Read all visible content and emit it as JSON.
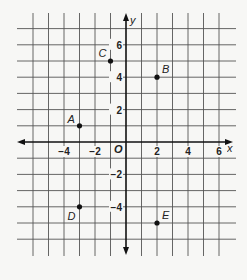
{
  "chart_data": {
    "type": "scatter",
    "title": "",
    "xlabel": "x",
    "ylabel": "y",
    "origin_label": "O",
    "xlim": [
      -6,
      6
    ],
    "ylim": [
      -6,
      7
    ],
    "grid": true,
    "x_ticks": [
      -4,
      -2,
      2,
      4,
      6
    ],
    "x_tick_labels": [
      "−4",
      "−2",
      "2",
      "4",
      "6"
    ],
    "y_ticks": [
      6,
      4,
      2,
      -2,
      -4
    ],
    "y_tick_labels": [
      "6",
      "4",
      "2",
      "−2",
      "−4"
    ],
    "points": [
      {
        "label": "A",
        "x": -3,
        "y": 1
      },
      {
        "label": "B",
        "x": 2,
        "y": 4
      },
      {
        "label": "C",
        "x": -1,
        "y": 5
      },
      {
        "label": "D",
        "x": -3,
        "y": -4
      },
      {
        "label": "E",
        "x": 2,
        "y": -5
      }
    ],
    "colors": {
      "grid": "#555555",
      "axis": "#111111",
      "point": "#111111",
      "background": "#f7f7f5"
    }
  }
}
